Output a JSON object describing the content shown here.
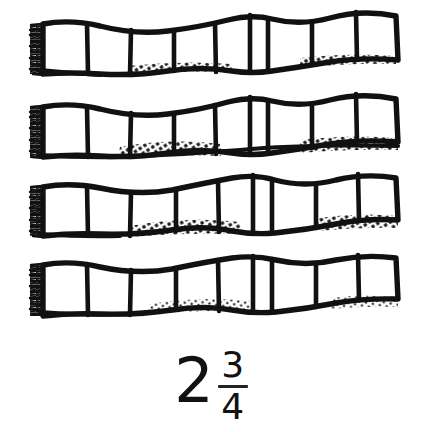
{
  "figure": {
    "kind": "fraction-bars-illustration",
    "style": "hand-drawn ink sketch",
    "background_color": "#ffffff",
    "ink_color": "#111111",
    "bar_count": 4,
    "cells_per_bar": 8,
    "bars": [
      {
        "index": 1,
        "cells": 8,
        "left_edge_shading": "hatched-fringe",
        "bottom_shading": "partial-crosshatch"
      },
      {
        "index": 2,
        "cells": 8,
        "left_edge_shading": "hatched-fringe",
        "bottom_shading": "heavy-crosshatch"
      },
      {
        "index": 3,
        "cells": 8,
        "left_edge_shading": "hatched-fringe",
        "bottom_shading": "heavy-crosshatch"
      },
      {
        "index": 4,
        "cells": 8,
        "left_edge_shading": "hatched-fringe",
        "bottom_shading": "light-crosshatch"
      }
    ]
  },
  "label": {
    "text": "2 3/4",
    "whole": "2",
    "numerator": "3",
    "denominator": "4"
  }
}
